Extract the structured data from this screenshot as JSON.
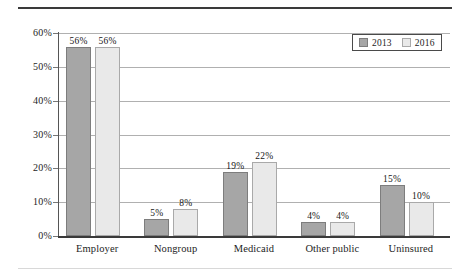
{
  "chart_data": {
    "type": "bar",
    "title": "",
    "subtitle": "",
    "xlabel": "",
    "ylabel": "",
    "categories": [
      "Employer",
      "Nongroup",
      "Medicaid",
      "Other public",
      "Uninsured"
    ],
    "series": [
      {
        "name": "2013",
        "color": "#a6a6a6",
        "values": [
          56,
          5,
          19,
          4,
          15
        ]
      },
      {
        "name": "2016",
        "color": "#e9e9e9",
        "values": [
          56,
          8,
          22,
          4,
          10
        ]
      }
    ],
    "value_labels": [
      [
        "56%",
        "5%",
        "19%",
        "4%",
        "15%"
      ],
      [
        "56%",
        "8%",
        "22%",
        "4%",
        "10%"
      ]
    ],
    "ylim": [
      0,
      60
    ],
    "ytick_values": [
      0,
      10,
      20,
      30,
      40,
      50,
      60
    ],
    "ytick_labels": [
      "0%",
      "10%",
      "20%",
      "30%",
      "40%",
      "50%",
      "60%"
    ],
    "grid": true,
    "legend_position": "top-right",
    "legend_entries": [
      "2013",
      "2016"
    ]
  }
}
